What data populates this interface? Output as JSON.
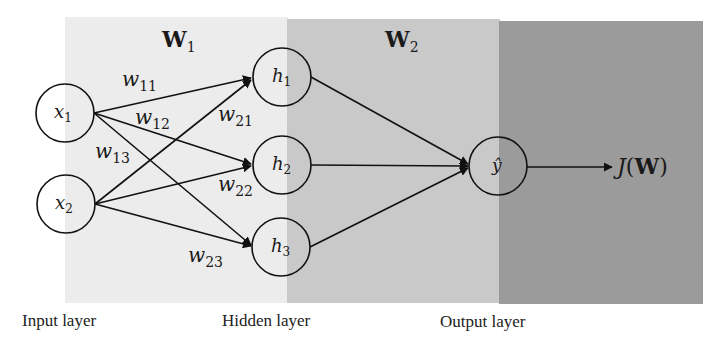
{
  "colors": {
    "input_panel": "#ececec",
    "hidden_panel": "#c9c9c9",
    "output_panel": "#9b9b9b",
    "stroke": "#111111"
  },
  "weights_labels": {
    "W1": {
      "base": "W",
      "sub": "1"
    },
    "W2": {
      "base": "W",
      "sub": "2"
    }
  },
  "nodes": {
    "x1": {
      "base": "x",
      "sub": "1"
    },
    "x2": {
      "base": "x",
      "sub": "2"
    },
    "h1": {
      "base": "h",
      "sub": "1"
    },
    "h2": {
      "base": "h",
      "sub": "2"
    },
    "h3": {
      "base": "h",
      "sub": "3"
    },
    "yhat": {
      "base": "ŷ"
    }
  },
  "edges": {
    "w11": {
      "base": "w",
      "sub": "11"
    },
    "w12": {
      "base": "w",
      "sub": "12"
    },
    "w13": {
      "base": "w",
      "sub": "13"
    },
    "w21": {
      "base": "w",
      "sub": "21"
    },
    "w22": {
      "base": "w",
      "sub": "22"
    },
    "w23": {
      "base": "w",
      "sub": "23"
    }
  },
  "loss": {
    "func": "J",
    "open": "(",
    "arg": "W",
    "close": ")"
  },
  "layer_labels": {
    "input": "Input layer",
    "hidden": "Hidden layer",
    "output": "Output layer"
  }
}
